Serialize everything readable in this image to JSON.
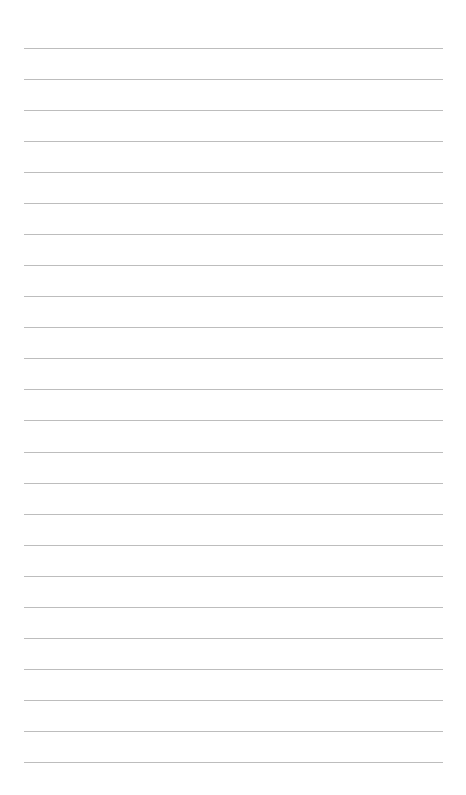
{
  "page": {
    "type": "lined-paper",
    "background_color": "#ffffff",
    "line_color": "#bdbdbd",
    "line_count": 24,
    "first_line_y": 48,
    "line_spacing": 31.04,
    "line_left": 24,
    "line_width": 419
  }
}
